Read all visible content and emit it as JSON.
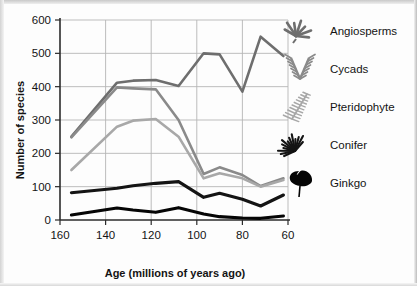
{
  "chart_data": {
    "type": "line",
    "title": "",
    "xlabel": "Age (millions of years ago)",
    "ylabel": "Number of species",
    "xlim": [
      160,
      60
    ],
    "ylim": [
      0,
      600
    ],
    "x_ticks": [
      160,
      140,
      120,
      100,
      80,
      60
    ],
    "y_ticks": [
      0,
      100,
      200,
      300,
      400,
      500,
      600
    ],
    "x_axis_reversed": true,
    "grid": true,
    "legend_position": "right",
    "x": [
      155,
      135,
      128,
      118,
      108,
      97,
      90,
      80,
      72,
      62
    ],
    "series": [
      {
        "name": "Angiosperms",
        "color": "#6e6e6e",
        "icon": "angiosperm-leaf-icon",
        "values": [
          250,
          412,
          418,
          420,
          402,
          500,
          497,
          385,
          550,
          492
        ]
      },
      {
        "name": "Cycads",
        "color": "#8a8a8a",
        "icon": "cycad-frond-icon",
        "values": [
          248,
          398,
          395,
          392,
          300,
          138,
          158,
          135,
          102,
          125
        ]
      },
      {
        "name": "Pteridophyte",
        "color": "#a8a8a8",
        "icon": "fern-frond-icon",
        "values": [
          150,
          280,
          298,
          303,
          250,
          125,
          140,
          125,
          100,
          120
        ]
      },
      {
        "name": "Conifer",
        "color": "#141414",
        "icon": "conifer-branch-icon",
        "values": [
          82,
          95,
          103,
          110,
          115,
          68,
          80,
          62,
          42,
          75
        ]
      },
      {
        "name": "Ginkgo",
        "color": "#050505",
        "icon": "ginkgo-leaf-icon",
        "values": [
          15,
          36,
          30,
          23,
          37,
          18,
          10,
          6,
          5,
          12
        ]
      }
    ]
  },
  "legend": {
    "items": [
      {
        "label": "Angiosperms",
        "icon": "angiosperm-leaf-icon"
      },
      {
        "label": "Cycads",
        "icon": "cycad-frond-icon"
      },
      {
        "label": "Pteridophyte",
        "icon": "fern-frond-icon"
      },
      {
        "label": "Conifer",
        "icon": "conifer-branch-icon"
      },
      {
        "label": "Ginkgo",
        "icon": "ginkgo-leaf-icon"
      }
    ]
  }
}
